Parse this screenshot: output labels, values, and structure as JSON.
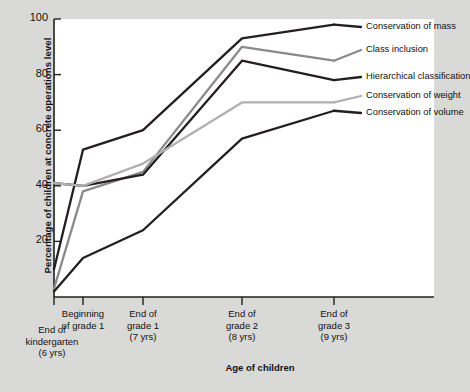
{
  "chart_data": {
    "type": "line",
    "title": "",
    "xlabel": "Age of children",
    "ylabel": "Percentage of children at concrete operations level",
    "categories": [
      "End of kindergarten (6 yrs)",
      "Beginning of grade 1",
      "End of grade 1 (7 yrs)",
      "End of grade 2 (8 yrs)",
      "End of grade 3 (9 yrs)"
    ],
    "category_lines": [
      [
        "End of",
        "kindergarten",
        "(6 yrs)"
      ],
      [
        "Beginning",
        "of grade 1"
      ],
      [
        "End of",
        "grade 1",
        "(7 yrs)"
      ],
      [
        "End of",
        "grade 2",
        "(8 yrs)"
      ],
      [
        "End of",
        "grade 3",
        "(9 yrs)"
      ]
    ],
    "ylim": [
      0,
      100
    ],
    "yticks": [
      20,
      40,
      60,
      80,
      100
    ],
    "xlim_categories": 5,
    "grid": false,
    "legend_position": "right-top-inside",
    "series": [
      {
        "name": "Conservation of mass",
        "color": "#231f20",
        "width": 2.3,
        "values": [
          10,
          53,
          60,
          93,
          98
        ]
      },
      {
        "name": "Class inclusion",
        "color": "#8a8a8a",
        "width": 2.3,
        "values": [
          3,
          38,
          45,
          90,
          85
        ]
      },
      {
        "name": "Hierarchical classification",
        "color": "#231f20",
        "width": 2.3,
        "values": [
          41,
          40,
          44,
          85,
          78
        ]
      },
      {
        "name": "Conservation of weight",
        "color": "#b0b0b0",
        "width": 2.3,
        "values": [
          41,
          40,
          48,
          70,
          70
        ]
      },
      {
        "name": "Conservation of volume",
        "color": "#231f20",
        "width": 2.3,
        "values": [
          2,
          14,
          24,
          57,
          67
        ]
      }
    ]
  },
  "axes": {
    "y_tick_labels": [
      "100",
      "80",
      "60",
      "40",
      "20"
    ],
    "y_tick_values": [
      100,
      80,
      60,
      40,
      20
    ]
  },
  "legend": {
    "items": [
      {
        "label": "Conservation of mass",
        "color": "#231f20"
      },
      {
        "label": "Class inclusion",
        "color": "#8a8a8a"
      },
      {
        "label": "Hierarchical classification",
        "color": "#231f20"
      },
      {
        "label": "Conservation of weight",
        "color": "#b0b0b0"
      },
      {
        "label": "Conservation of volume",
        "color": "#231f20"
      }
    ]
  }
}
